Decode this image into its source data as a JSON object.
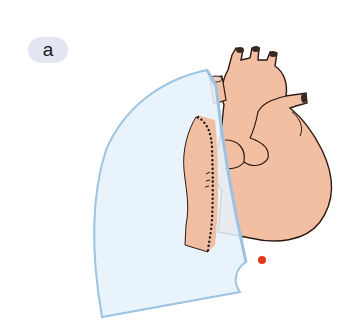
{
  "panel": {
    "label": "a"
  },
  "illustration": {
    "subject": "heart with lung overlay",
    "colors": {
      "heart_fill": "#f3bfa3",
      "heart_stroke": "#2a1a14",
      "lung_fill": "#e6f1fa",
      "lung_stroke": "#9cc4e2",
      "marker": "#e33a1f"
    }
  }
}
